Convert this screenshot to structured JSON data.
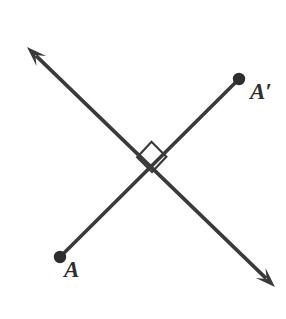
{
  "figure": {
    "name": "perpendicular-lines-diagram",
    "width": 286,
    "height": 319,
    "background_color": "#ffffff",
    "stroke_color": "#3a3a3a",
    "stroke_width": 3.6
  },
  "labels": {
    "point_a": "A",
    "point_a_prime": "A′"
  },
  "points": [
    {
      "name": "A",
      "label": "A",
      "x": 60,
      "y": 257,
      "radius": 6.2,
      "filled": true
    },
    {
      "name": "A-prime",
      "label": "A′",
      "x": 239,
      "y": 79,
      "radius": 6.2,
      "filled": true
    }
  ],
  "segments": [
    {
      "name": "segment-A-to-A-prime",
      "from": {
        "x": 60,
        "y": 257
      },
      "to": {
        "x": 239,
        "y": 79
      },
      "arrow_start": false,
      "arrow_end": false
    }
  ],
  "lines": [
    {
      "name": "double-headed-line",
      "from": {
        "x": 27,
        "y": 47
      },
      "to": {
        "x": 275,
        "y": 287
      },
      "arrow_start": true,
      "arrow_end": true
    }
  ],
  "intersection": {
    "name": "intersection-point",
    "x": 152,
    "y": 172
  },
  "right_angle_marker": {
    "name": "right-angle-marker",
    "vertex": {
      "x": 152,
      "y": 172
    },
    "arm_length": 21,
    "square_points": "152,172 138,157 154,143 169,158"
  },
  "arrowheads": [
    {
      "name": "arrowhead-upper-left",
      "tip_x": 27,
      "tip_y": 47,
      "length": 20,
      "half_width": 7
    },
    {
      "name": "arrowhead-lower-right",
      "tip_x": 275,
      "tip_y": 287,
      "length": 20,
      "half_width": 7
    }
  ]
}
